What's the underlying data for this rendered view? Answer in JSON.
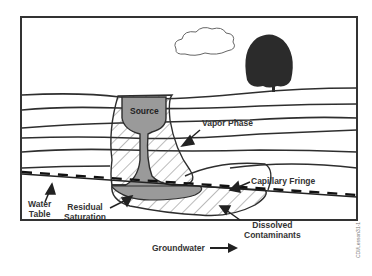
{
  "diagram": {
    "type": "subsurface contamination cross-section",
    "labels": {
      "source": "Source",
      "vapor_phase": "Vapor Phase",
      "capillary_fringe": "Capillary Fringe",
      "water_table_line1": "Water",
      "water_table_line2": "Table",
      "residual_line1": "Residual",
      "residual_line2": "Saturation",
      "dissolved_line1": "Dissolved",
      "dissolved_line2": "Contaminants",
      "groundwater": "Groundwater"
    },
    "credit": "CDI/Lesson31-1",
    "colors": {
      "outline": "#2a2a2a",
      "contaminant_fill": "#9a9a9a",
      "tree": "#2b2b2b",
      "background": "#ffffff"
    }
  }
}
